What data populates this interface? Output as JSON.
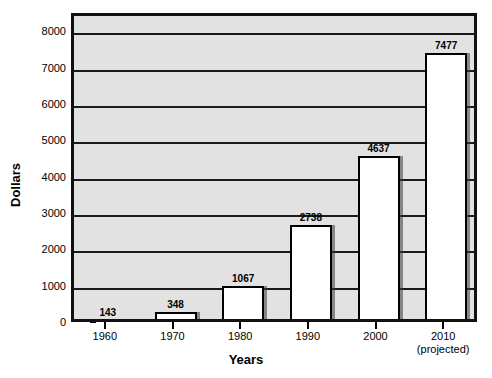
{
  "chart_data": {
    "type": "bar",
    "title": "",
    "xlabel": "Years",
    "ylabel": "Dollars",
    "categories": [
      "1960",
      "1970",
      "1980",
      "1990",
      "2000",
      "2010"
    ],
    "category_sublabels": [
      "",
      "",
      "",
      "",
      "",
      "(projected)"
    ],
    "values": [
      143,
      348,
      1067,
      2738,
      4637,
      7477
    ],
    "value_labels": [
      "143",
      "348",
      "1067",
      "2738",
      "4637",
      "7477"
    ],
    "ylim": [
      0,
      8500
    ],
    "yticks": [
      0,
      1000,
      2000,
      3000,
      4000,
      5000,
      6000,
      7000,
      8000
    ],
    "ytick_labels": [
      "0",
      "1000",
      "2000",
      "3000",
      "4000",
      "5000",
      "6000",
      "7000",
      "8000"
    ],
    "grid": true,
    "grid_axis": "y",
    "legend": false,
    "colors": {
      "bar_fill": "#ffffff",
      "bar_border": "#000000",
      "plot_background": "#e2e2e2",
      "gridline": "#1a1a1a",
      "axis": "#111111",
      "text": "#000000"
    }
  }
}
